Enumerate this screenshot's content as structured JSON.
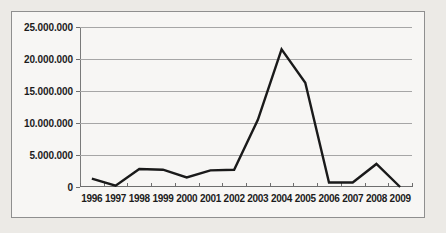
{
  "chart_data": {
    "type": "line",
    "title": "",
    "subtitle": "",
    "xlabel": "",
    "ylabel": "",
    "categories": [
      "1996",
      "1997",
      "1998",
      "1999",
      "2000",
      "2001",
      "2002",
      "2003",
      "2004",
      "2005",
      "2006",
      "2007",
      "2008",
      "2009"
    ],
    "series": [
      {
        "name": "",
        "values": [
          1300000,
          200000,
          2800000,
          2700000,
          1500000,
          2600000,
          2700000,
          10500000,
          21500000,
          16300000,
          700000,
          700000,
          3600000,
          0
        ]
      }
    ],
    "ylim": [
      0,
      25000000
    ],
    "ytick_values": [
      0,
      5000000,
      10000000,
      15000000,
      20000000,
      25000000
    ],
    "ytick_labels": [
      "0",
      "5.000.000",
      "10.000.000",
      "15.000.000",
      "20.000.000",
      "25.000.000"
    ],
    "grid": true,
    "grid_axis": "y",
    "legend": false,
    "legend_position": "none",
    "line_color": "#1a1a1a",
    "line_width": 2.4,
    "markers": false,
    "plot_background": "#f7f6f4",
    "page_background": "#eceae6",
    "grid_color": "#a6a6a6",
    "axis_color": "#6e6e6e",
    "frame_border_color": "#8f8f8f",
    "number_format": "european-dot-thousands"
  }
}
